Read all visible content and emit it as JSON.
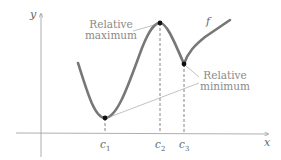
{
  "axes": {
    "x_label": "x",
    "y_label": "y"
  },
  "function_label": "f",
  "ticks": [
    {
      "label": "c",
      "sub": "1",
      "x": 105
    },
    {
      "label": "c",
      "sub": "2",
      "x": 160
    },
    {
      "label": "c",
      "sub": "3",
      "x": 184
    }
  ],
  "annotations": {
    "max": {
      "line1": "Relative",
      "line2": "maximum"
    },
    "min": {
      "line1": "Relative",
      "line2": "minimum"
    }
  },
  "colors": {
    "curve": "#777777",
    "axis": "#9a9a9a",
    "point": "#111111",
    "text": "#8a8a8a"
  }
}
